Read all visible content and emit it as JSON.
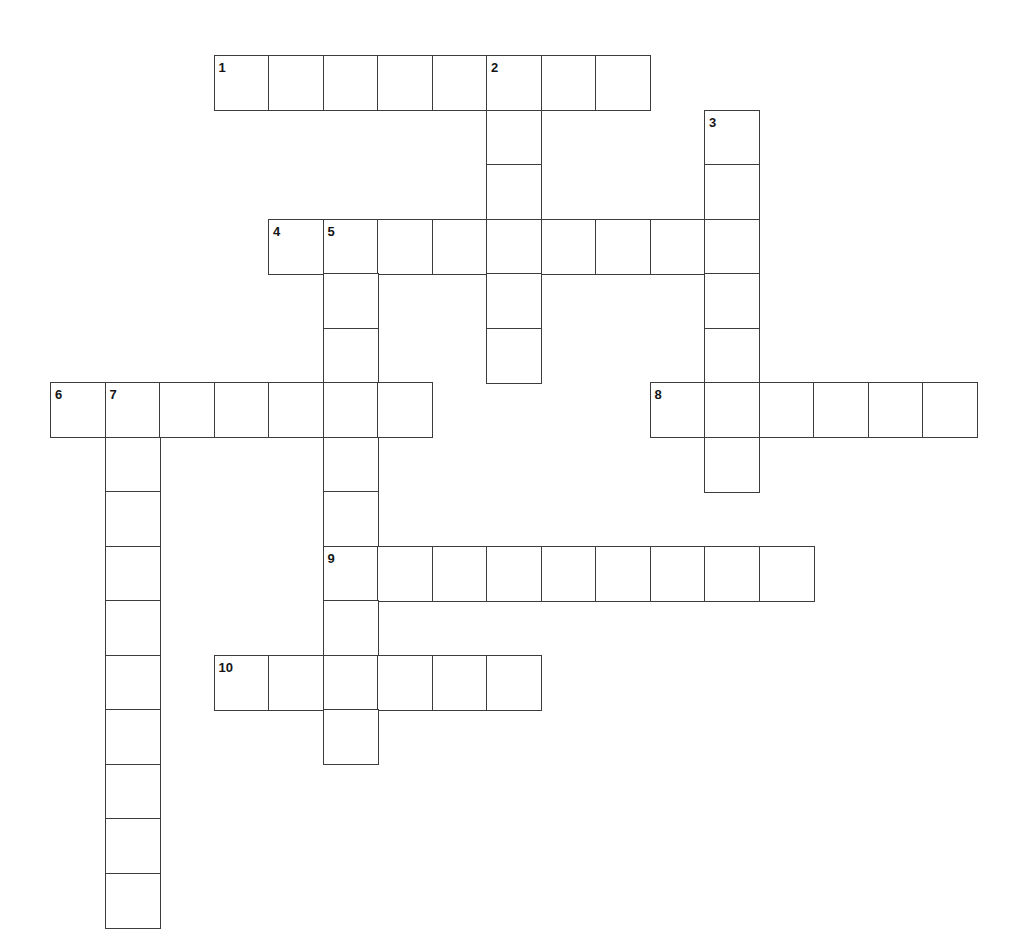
{
  "puzzle": {
    "title": "Crossword Puzzle Grid",
    "type": "crossword-grid",
    "width": 1011,
    "height": 942,
    "background_color": "#ffffff",
    "cell_border_color": "#3c3c3c",
    "cell_fill_color": "#ffffff",
    "number_color": "#151515",
    "cell_size": 54.5,
    "origin": {
      "x": 50,
      "y": 55
    },
    "columns": 18,
    "rows": 16,
    "numbered_clue_count": 10,
    "across_count": 6,
    "down_count": 4,
    "entries": [
      {
        "number": "1",
        "direction": "across",
        "row": 0,
        "col": 3,
        "length": 8
      },
      {
        "number": "2",
        "direction": "down",
        "row": 0,
        "col": 8,
        "length": 6
      },
      {
        "number": "3",
        "direction": "down",
        "row": 1,
        "col": 12,
        "length": 7
      },
      {
        "number": "4",
        "direction": "across",
        "row": 3,
        "col": 4,
        "length": 9
      },
      {
        "number": "5",
        "direction": "down",
        "row": 3,
        "col": 5,
        "length": 10
      },
      {
        "number": "6",
        "direction": "across",
        "row": 6,
        "col": 0,
        "length": 7
      },
      {
        "number": "7",
        "direction": "down",
        "row": 6,
        "col": 1,
        "length": 10
      },
      {
        "number": "8",
        "direction": "across",
        "row": 6,
        "col": 11,
        "length": 6
      },
      {
        "number": "9",
        "direction": "across",
        "row": 9,
        "col": 5,
        "length": 9
      },
      {
        "number": "10",
        "direction": "across",
        "row": 11,
        "col": 3,
        "length": 6
      }
    ],
    "numbers": [
      {
        "label": "1",
        "row": 0,
        "col": 3
      },
      {
        "label": "2",
        "row": 0,
        "col": 8
      },
      {
        "label": "3",
        "row": 1,
        "col": 12
      },
      {
        "label": "4",
        "row": 3,
        "col": 4
      },
      {
        "label": "5",
        "row": 3,
        "col": 5
      },
      {
        "label": "6",
        "row": 6,
        "col": 0
      },
      {
        "label": "7",
        "row": 6,
        "col": 1
      },
      {
        "label": "8",
        "row": 6,
        "col": 11
      },
      {
        "label": "9",
        "row": 9,
        "col": 5
      },
      {
        "label": "10",
        "row": 11,
        "col": 3
      }
    ]
  }
}
